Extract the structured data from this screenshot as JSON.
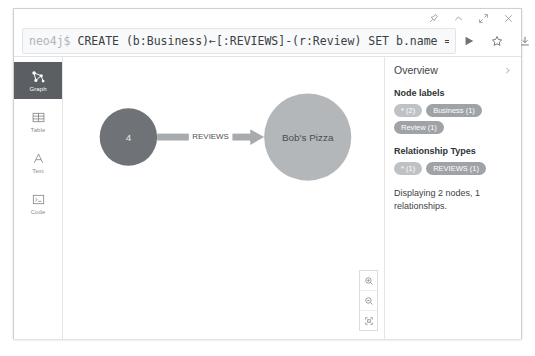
{
  "window": {
    "controls": [
      {
        "name": "pin-icon",
        "label": "Pin"
      },
      {
        "name": "collapse-icon",
        "label": "Collapse"
      },
      {
        "name": "expand-icon",
        "label": "Expand"
      },
      {
        "name": "close-icon",
        "label": "Close"
      }
    ]
  },
  "editor": {
    "prompt": "neo4j$ ",
    "query": "CREATE (b:Business)←[:REVIEWS]-(r:Review) SET b.name = \"Bob'…",
    "actions": [
      {
        "name": "run-query-icon",
        "label": "Run"
      },
      {
        "name": "favorite-star-icon",
        "label": "Favorite"
      },
      {
        "name": "download-icon",
        "label": "Download"
      }
    ]
  },
  "rail": {
    "items": [
      {
        "label": "Graph",
        "icon": "graph-icon",
        "active": true
      },
      {
        "label": "Table",
        "icon": "table-icon",
        "active": false
      },
      {
        "label": "Text",
        "icon": "text-icon",
        "active": false
      },
      {
        "label": "Code",
        "icon": "code-icon",
        "active": false
      }
    ]
  },
  "graph": {
    "nodes": [
      {
        "id": "review",
        "caption": "4",
        "color": "#6f7276",
        "radius": 29,
        "cx": 66,
        "cy": 80,
        "text_theme": "dark"
      },
      {
        "id": "business",
        "caption": "Bob's Pizza",
        "color": "#b4b7ba",
        "radius": 44,
        "cx": 247,
        "cy": 80,
        "text_theme": "light"
      }
    ],
    "relationship": {
      "caption": "REVIEWS",
      "color": "#a8abae",
      "from": "review",
      "to": "business"
    },
    "zoom_controls": [
      {
        "name": "zoom-in-icon",
        "label": "Zoom in"
      },
      {
        "name": "zoom-out-icon",
        "label": "Zoom out"
      },
      {
        "name": "zoom-fit-icon",
        "label": "Fit to screen"
      }
    ]
  },
  "sidebar": {
    "title": "Overview",
    "node_labels_title": "Node labels",
    "node_labels": [
      {
        "text": "* (2)",
        "kind": "star"
      },
      {
        "text": "Business (1)",
        "kind": "label"
      },
      {
        "text": "Review (1)",
        "kind": "label"
      }
    ],
    "relationship_types_title": "Relationship Types",
    "relationship_types": [
      {
        "text": "* (1)",
        "kind": "star"
      },
      {
        "text": "REVIEWS (1)",
        "kind": "label"
      }
    ],
    "summary": "Displaying 2 nodes, 1 relationships."
  },
  "colors": {
    "node_dark": "#6f7276",
    "node_light": "#b4b7ba",
    "relationship": "#a8abae",
    "rail_active": "#5b5f63",
    "chip_star": "#bfc2c5",
    "chip_label": "#9fa3a7"
  }
}
